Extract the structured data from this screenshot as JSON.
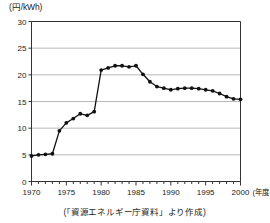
{
  "figure": {
    "y_unit_label": "(円/kWh)",
    "x_unit_label": "(年度)",
    "caption": "(「資源エネルギー庁資料」より作成)"
  },
  "colors": {
    "line": "#111111",
    "marker": "#111111",
    "grid": "#9a9a9a",
    "axis": "#333333",
    "background": "#ffffff"
  },
  "chart_data": {
    "type": "line",
    "title": "",
    "subtitle": "",
    "xlabel": "(年度)",
    "ylabel": "(円/kWh)",
    "xlim": [
      1970,
      2000
    ],
    "ylim": [
      0,
      30
    ],
    "yticks": [
      0,
      5,
      10,
      15,
      20,
      25,
      30
    ],
    "ytick_labels": [
      "0",
      "5",
      "10",
      "15",
      "20",
      "25",
      "30"
    ],
    "xticks": [
      1970,
      1975,
      1980,
      1985,
      1990,
      1995,
      2000
    ],
    "xtick_labels": [
      "1970",
      "1975",
      "1980",
      "1985",
      "1990",
      "1995",
      "2000"
    ],
    "x_minor_tick_interval": 1,
    "grid": "horizontal",
    "legend": "none",
    "markers": "filled-circle",
    "series": [
      {
        "name": "電気料金単価",
        "x": [
          1970,
          1971,
          1972,
          1973,
          1974,
          1975,
          1976,
          1977,
          1978,
          1979,
          1980,
          1981,
          1982,
          1983,
          1984,
          1985,
          1986,
          1987,
          1988,
          1989,
          1990,
          1991,
          1992,
          1993,
          1994,
          1995,
          1996,
          1997,
          1998,
          1999,
          2000
        ],
        "values": [
          4.8,
          5.0,
          5.1,
          5.2,
          9.5,
          11.0,
          11.8,
          12.7,
          12.4,
          13.1,
          20.9,
          21.3,
          21.7,
          21.7,
          21.5,
          21.7,
          20.1,
          18.7,
          17.8,
          17.5,
          17.2,
          17.4,
          17.5,
          17.5,
          17.4,
          17.2,
          17.0,
          16.5,
          15.9,
          15.5,
          15.4
        ]
      }
    ]
  }
}
